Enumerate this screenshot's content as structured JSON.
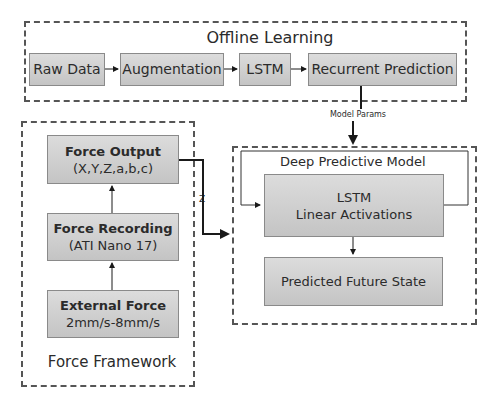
{
  "offline_learning": {
    "title": "Offline Learning",
    "steps": [
      {
        "label": "Raw Data"
      },
      {
        "label": "Augmentation"
      },
      {
        "label": "LSTM"
      },
      {
        "label": "Recurrent Prediction"
      }
    ]
  },
  "model_params_label": "Model Params",
  "force_framework": {
    "title": "Force Framework",
    "force_output": {
      "title": "Force Output",
      "subtitle": "(X,Y,Z,a,b,c)"
    },
    "force_recording": {
      "title": "Force Recording",
      "subtitle": "(ATI Nano 17)"
    },
    "external_force": {
      "title": "External Force",
      "subtitle": "2mm/s-8mm/s"
    }
  },
  "z_label": "Z",
  "deep_predictive_model": {
    "title": "Deep Predictive Model",
    "lstm": {
      "line1": "LSTM",
      "line2": "Linear Activations"
    },
    "predicted": {
      "label": "Predicted Future State"
    }
  },
  "colors": {
    "box_fill_top": "#dcdcdc",
    "box_fill_bottom": "#c4c4c4",
    "box_border": "#8a8a8a",
    "dash": "#555555",
    "arrow": "#1a1a1a"
  }
}
